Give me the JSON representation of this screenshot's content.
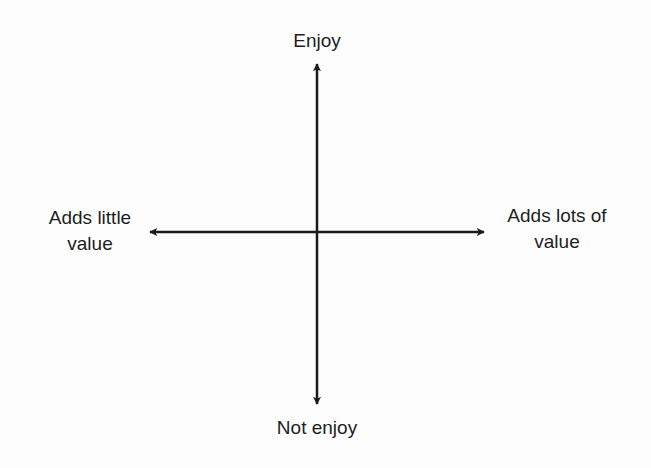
{
  "diagram": {
    "type": "quadrant-axes",
    "axes": {
      "vertical": {
        "top_label": "Enjoy",
        "bottom_label": "Not enjoy"
      },
      "horizontal": {
        "left_label_line1": "Adds little",
        "left_label_line2": "value",
        "right_label_line1": "Adds lots of",
        "right_label_line2": "value"
      }
    },
    "colors": {
      "line": "#1a1a1a",
      "text": "#1e1e1e",
      "background": "#fdfdfd"
    }
  }
}
